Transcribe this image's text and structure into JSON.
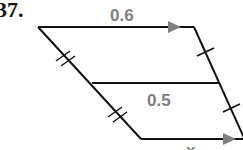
{
  "problem_number": "37.",
  "labels": {
    "top": "0.6",
    "middle": "0.5",
    "bottom": "x"
  },
  "colors": {
    "lines": "#111111",
    "labels": "#808080",
    "arrows": "#808080"
  }
}
